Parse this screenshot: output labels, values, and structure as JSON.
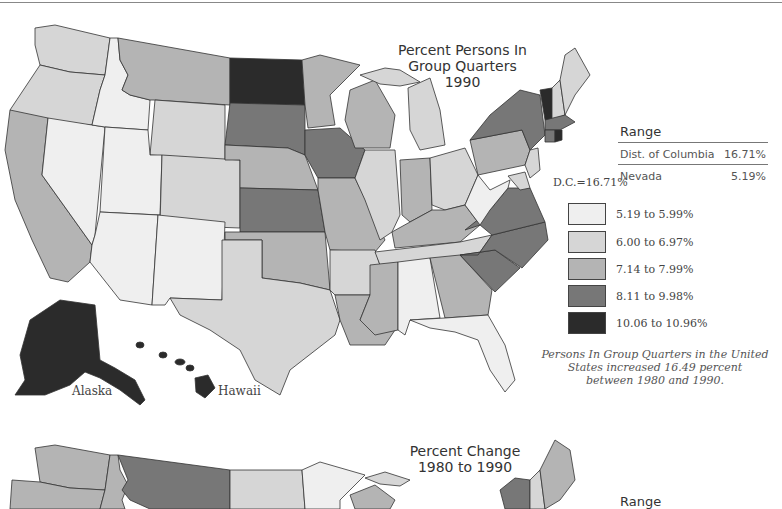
{
  "map1": {
    "title_line1": "Percent Persons In",
    "title_line2": "Group Quarters",
    "title_line3": "1990",
    "range": {
      "title": "Range",
      "rows": [
        {
          "label": "Dist. of Columbia",
          "value": "16.71%"
        },
        {
          "label": "Nevada",
          "value": "5.19%"
        }
      ]
    },
    "dc_label": "D.C.=16.71%",
    "legend": [
      {
        "label": "5.19 to 5.99%",
        "color": "#efefef"
      },
      {
        "label": "6.00 to 6.97%",
        "color": "#d6d6d6"
      },
      {
        "label": "7.14 to 7.99%",
        "color": "#b4b4b4"
      },
      {
        "label": "8.11 to 9.98%",
        "color": "#777777"
      },
      {
        "label": "10.06 to 10.96%",
        "color": "#2b2b2b"
      }
    ],
    "note_line1": "Persons In Group Quarters in the United",
    "note_line2": "States increased 16.49 percent",
    "note_line3": "between 1980 and 1990.",
    "alaska_label": "Alaska",
    "hawaii_label": "Hawaii"
  },
  "map2": {
    "title_line1": "Percent Change",
    "title_line2": "1980 to 1990",
    "range_title": "Range"
  }
}
